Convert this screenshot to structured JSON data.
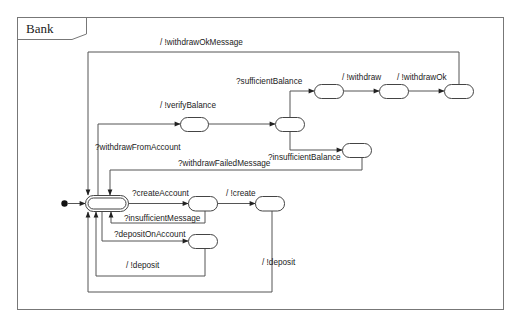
{
  "diagram": {
    "type": "state-machine",
    "frame_title": "Bank",
    "states": [
      {
        "id": "initial",
        "kind": "initial-pseudostate"
      },
      {
        "id": "idle",
        "kind": "main-state"
      },
      {
        "id": "verifying",
        "kind": "state"
      },
      {
        "id": "checking",
        "kind": "state"
      },
      {
        "id": "sufficient",
        "kind": "state"
      },
      {
        "id": "withdrawing",
        "kind": "state"
      },
      {
        "id": "withdrawn",
        "kind": "state"
      },
      {
        "id": "insufficient",
        "kind": "state"
      },
      {
        "id": "creating",
        "kind": "state"
      },
      {
        "id": "created",
        "kind": "state"
      },
      {
        "id": "depositing",
        "kind": "state"
      }
    ],
    "transitions": [
      {
        "id": "t_withdrawOkMessage",
        "from": "withdrawn",
        "to": "idle",
        "label": "/ !withdrawOkMessage"
      },
      {
        "id": "t_sufficientBalance",
        "from": "checking",
        "to": "sufficient",
        "label": "?sufficientBalance"
      },
      {
        "id": "t_withdraw",
        "from": "sufficient",
        "to": "withdrawing",
        "label": "/ !withdraw"
      },
      {
        "id": "t_withdrawOk",
        "from": "withdrawing",
        "to": "withdrawn",
        "label": "/ !withdrawOk"
      },
      {
        "id": "t_verifyBalance",
        "from": "verifying",
        "to": "checking",
        "label": "/ !verifyBalance"
      },
      {
        "id": "t_withdrawFromAccount",
        "from": "idle",
        "to": "verifying",
        "label": "?withdrawFromAccount"
      },
      {
        "id": "t_insufficientBalance",
        "from": "checking",
        "to": "insufficient",
        "label": "?insufficientBalance"
      },
      {
        "id": "t_withdrawFailedMessage",
        "from": "insufficient",
        "to": "idle",
        "label": "?withdrawFailedMessage"
      },
      {
        "id": "t_createAccount",
        "from": "idle",
        "to": "creating",
        "label": "?createAccount"
      },
      {
        "id": "t_create",
        "from": "creating",
        "to": "created",
        "label": "/ !create"
      },
      {
        "id": "t_insufficientMessage",
        "from": "creating",
        "to": "idle",
        "label": "?insufficientMessage"
      },
      {
        "id": "t_depositOnAccount",
        "from": "idle",
        "to": "depositing",
        "label": "?depositOnAccount"
      },
      {
        "id": "t_deposit_1",
        "from": "depositing",
        "to": "idle",
        "label": "/ !deposit"
      },
      {
        "id": "t_deposit_2",
        "from": "created",
        "to": "idle",
        "label": "/ !deposit"
      }
    ]
  },
  "labels": {
    "frame_title": "Bank",
    "withdrawOkMessage": "/ !withdrawOkMessage",
    "sufficientBalance": "?sufficientBalance",
    "withdraw": "/ !withdraw",
    "withdrawOk": "/ !withdrawOk",
    "verifyBalance": "/ !verifyBalance",
    "withdrawFromAccount": "?withdrawFromAccount",
    "insufficientBalance": "?insufficientBalance",
    "withdrawFailedMessage": "?withdrawFailedMessage",
    "createAccount": "?createAccount",
    "create": "/ !create",
    "insufficientMessage": "?insufficientMessage",
    "depositOnAccount": "?depositOnAccount",
    "deposit_inner": "/ !deposit",
    "deposit_outer": "/ !deposit"
  },
  "colors": {
    "stroke": "#444444",
    "edge": "#555555",
    "background": "#ffffff"
  }
}
